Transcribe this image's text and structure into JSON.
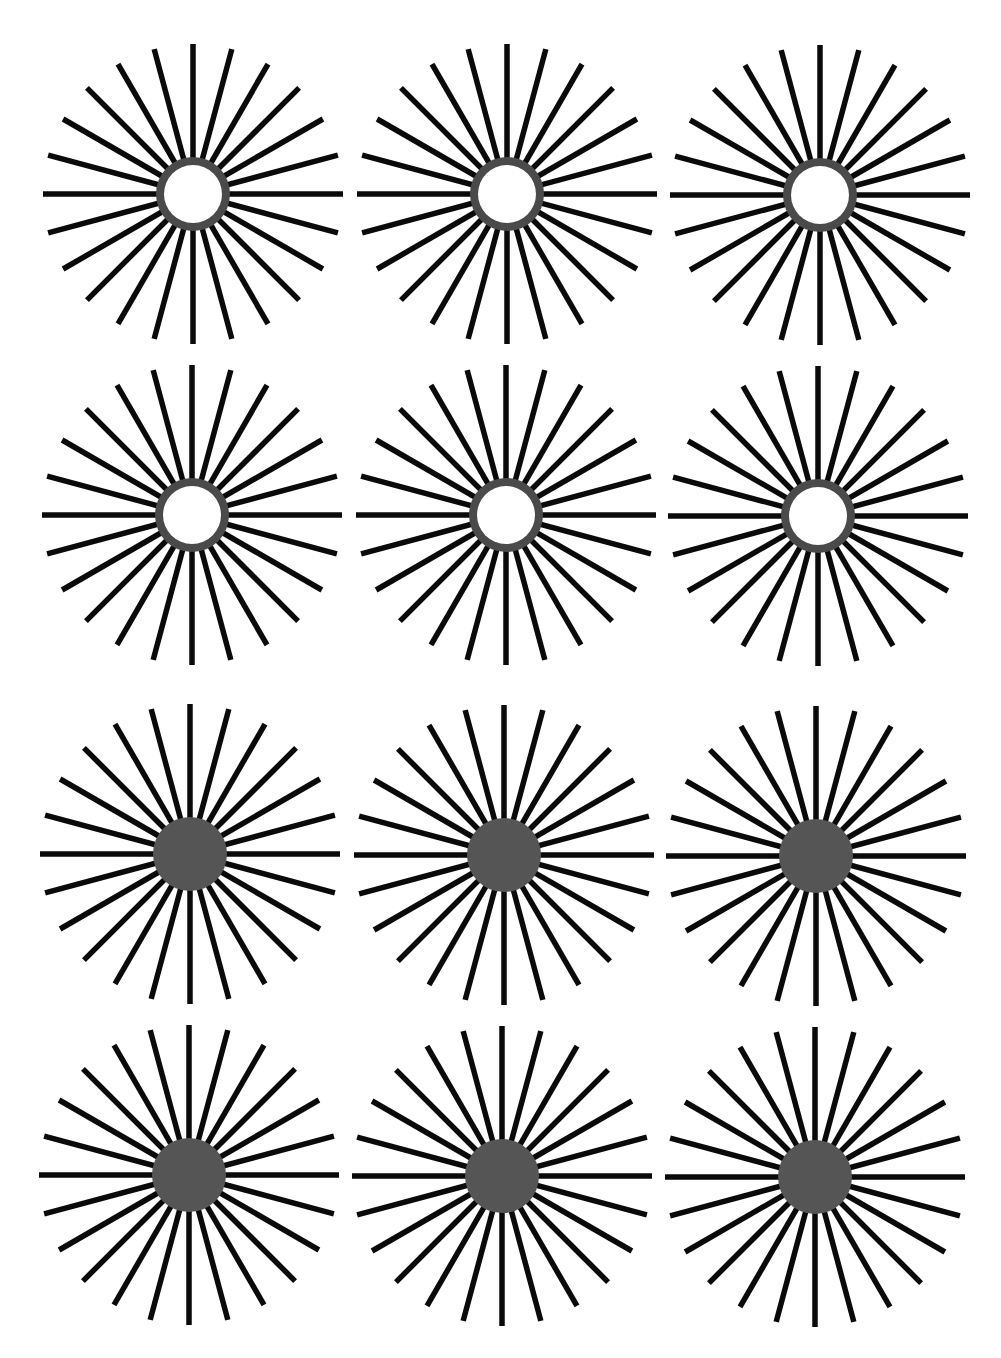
{
  "figure": {
    "width": 1001,
    "height": 1358,
    "background": "#ffffff",
    "ray_color": "#0a0a0a",
    "ray_count": 24,
    "ray_width": 5.5,
    "ray_length": 150,
    "ray_inner_gap": 0,
    "ring_color": "#4a4a4a",
    "disc_color": "#555555",
    "ring_inner_fill": "#ffffff",
    "center_outer_radius": 37,
    "ring_inner_radius": 29
  },
  "stars": [
    {
      "row": 1,
      "col": 1,
      "cx": 193,
      "cy": 194,
      "center": "ring"
    },
    {
      "row": 1,
      "col": 2,
      "cx": 507,
      "cy": 194,
      "center": "ring"
    },
    {
      "row": 1,
      "col": 3,
      "cx": 820,
      "cy": 195,
      "center": "ring"
    },
    {
      "row": 2,
      "col": 1,
      "cx": 192,
      "cy": 515,
      "center": "ring"
    },
    {
      "row": 2,
      "col": 2,
      "cx": 506,
      "cy": 515,
      "center": "ring"
    },
    {
      "row": 2,
      "col": 3,
      "cx": 818,
      "cy": 516,
      "center": "ring"
    },
    {
      "row": 3,
      "col": 1,
      "cx": 190,
      "cy": 854,
      "center": "disc"
    },
    {
      "row": 3,
      "col": 2,
      "cx": 504,
      "cy": 855,
      "center": "disc"
    },
    {
      "row": 3,
      "col": 3,
      "cx": 816,
      "cy": 856,
      "center": "disc"
    },
    {
      "row": 4,
      "col": 1,
      "cx": 189,
      "cy": 1175,
      "center": "disc"
    },
    {
      "row": 4,
      "col": 2,
      "cx": 502,
      "cy": 1176,
      "center": "disc"
    },
    {
      "row": 4,
      "col": 3,
      "cx": 815,
      "cy": 1177,
      "center": "disc"
    }
  ]
}
